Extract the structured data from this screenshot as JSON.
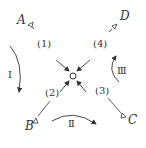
{
  "points": {
    "A": "A",
    "B": "B",
    "C": "C",
    "D": "D"
  },
  "paths": {
    "p1": "(1)",
    "p2": "(2)",
    "p3": "(3)",
    "p4": "(4)"
  },
  "rotations": {
    "r1": "Ⅰ",
    "r2": "Ⅱ",
    "r3": "Ⅲ"
  },
  "colors": {
    "stroke": "#333333",
    "background": "#ffffff"
  }
}
